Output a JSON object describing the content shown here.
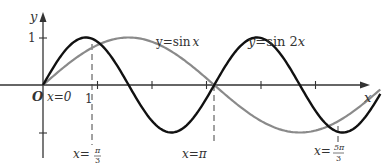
{
  "chart_data": {
    "type": "line",
    "title": "",
    "xlabel": "x",
    "ylabel": "y",
    "origin_label": "O",
    "xlim": [
      0,
      6.2832
    ],
    "ylim": [
      -1,
      1
    ],
    "grid": false,
    "legend": "inline labels",
    "series": [
      {
        "name": "y = sin x",
        "label": "y=sin x",
        "color": "#8a8a8a",
        "function": "sin(x)",
        "x": [
          0,
          0.5236,
          1.0472,
          1.5708,
          2.0944,
          2.618,
          3.1416,
          3.6652,
          4.1888,
          4.7124,
          5.236,
          5.7596,
          6.2832
        ],
        "values": [
          0,
          0.5,
          0.866,
          1,
          0.866,
          0.5,
          0,
          -0.5,
          -0.866,
          -1,
          -0.866,
          -0.5,
          0
        ]
      },
      {
        "name": "y = sin 2x",
        "label": "y=sin 2x",
        "color": "#111111",
        "function": "sin(2x)",
        "x": [
          0,
          0.3927,
          0.7854,
          1.1781,
          1.5708,
          1.9635,
          2.3562,
          2.7489,
          3.1416,
          3.5343,
          3.927,
          4.3197,
          4.7124,
          5.1051,
          5.4978,
          5.8905,
          6.2832
        ],
        "values": [
          0,
          0.7071,
          1,
          0.7071,
          0,
          -0.7071,
          -1,
          -0.7071,
          0,
          0.7071,
          1,
          0.7071,
          0,
          -0.7071,
          -1,
          -0.7071,
          0
        ]
      }
    ],
    "x_ticks": [
      1,
      2,
      3,
      4,
      5
    ],
    "x_tick_labels": [
      "1"
    ],
    "y_ticks": [
      1,
      -1
    ],
    "y_tick_labels": [
      "1"
    ],
    "annotations": [
      {
        "text": "x=0",
        "x": 0,
        "note": "origin intersection"
      },
      {
        "text": "x=π/3",
        "x": 1.0472,
        "y": 0.866,
        "style": "dashed"
      },
      {
        "text": "x=π",
        "x": 3.1416,
        "y": 0,
        "style": "dashed"
      },
      {
        "text": "x=5π/3",
        "x": 5.236,
        "y": -0.866,
        "style": "dashed"
      }
    ]
  },
  "labels": {
    "y_axis": "y",
    "x_axis": "x",
    "origin": "O",
    "x_zero": "x=0",
    "one_x": "1",
    "one_y": "1",
    "sinx": "y=sin x",
    "sin2x": "y=sin 2x",
    "pi_over_3_prefix": "x=",
    "pi_over_3_num": "π",
    "pi_over_3_den": "3",
    "pi_prefix": "x=π",
    "five_pi_prefix": "x=",
    "five_pi_num": "5π",
    "five_pi_den": "3"
  }
}
